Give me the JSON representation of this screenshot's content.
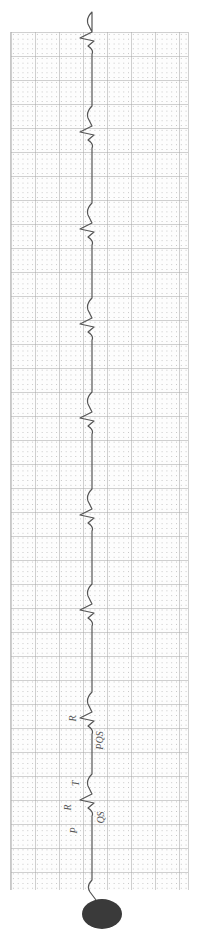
{
  "strip": {
    "type": "ECG rhythm strip (rotated 90°)",
    "grid": {
      "major_px": 24,
      "minor_px": 4.8,
      "line_color": "#aaaaaa"
    },
    "trace_color": "#555555",
    "baseline_x": 92,
    "r_peaks_y": [
      38,
      132,
      229,
      324,
      418,
      515,
      610,
      718,
      800
    ]
  },
  "annotations": [
    {
      "text": "R",
      "x": 69,
      "y": 713
    },
    {
      "text": "PQS",
      "x": 90,
      "y": 735
    },
    {
      "text": "T",
      "x": 73,
      "y": 778
    },
    {
      "text": "R",
      "x": 64,
      "y": 802
    },
    {
      "text": "QS",
      "x": 94,
      "y": 812
    },
    {
      "text": "P",
      "x": 70,
      "y": 825
    }
  ],
  "stamp": {
    "text": ""
  }
}
